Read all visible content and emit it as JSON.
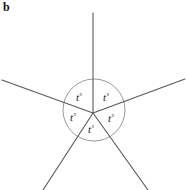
{
  "panel": {
    "label": "b"
  },
  "figure": {
    "type": "angles-at-a-point",
    "vertex_label": "",
    "colors": {
      "ray": "#595959",
      "arc": "#8c8c8c",
      "text": "#1a1a1a",
      "background": "#ffffff"
    },
    "arc": {
      "cx": 94,
      "cy": 110,
      "r": 31
    },
    "vertex": {
      "x": 93,
      "y": 113
    },
    "rays": [
      {
        "name": "ray-up",
        "x2": 93,
        "y2": 13
      },
      {
        "name": "ray-upper-right",
        "x2": 185,
        "y2": 79
      },
      {
        "name": "ray-lower-right",
        "x2": 148,
        "y2": 190
      },
      {
        "name": "ray-lower-left",
        "x2": 43,
        "y2": 190
      },
      {
        "name": "ray-upper-left",
        "x2": 2,
        "y2": 80
      }
    ],
    "angle_labels": [
      {
        "name": "angle-label-top-left",
        "text": "t",
        "degree": "°",
        "x": 76,
        "y": 101
      },
      {
        "name": "angle-label-top-right",
        "text": "t",
        "degree": "°",
        "x": 103,
        "y": 101
      },
      {
        "name": "angle-label-left",
        "text": "t",
        "degree": "°",
        "x": 70,
        "y": 121
      },
      {
        "name": "angle-label-right",
        "text": "t",
        "degree": "°",
        "x": 108,
        "y": 122
      },
      {
        "name": "angle-label-bottom",
        "text": "t",
        "degree": "°",
        "x": 88,
        "y": 133
      }
    ]
  }
}
